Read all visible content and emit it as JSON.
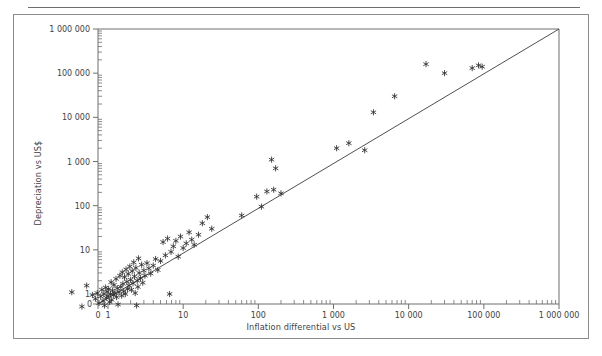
{
  "figure": {
    "has_top_rule": true,
    "border_color": "#8c8c8c",
    "background": "#ffffff"
  },
  "chart_data": {
    "type": "scatter",
    "title": "",
    "subtitle": "",
    "xlabel": "Inflation differential vs US",
    "ylabel": "Depreciation vs US$",
    "x_scale": "log",
    "y_scale": "log",
    "xlim": [
      1,
      1000000
    ],
    "ylim": [
      1,
      1000000
    ],
    "x_tick_labels": [
      "0",
      "1",
      "10",
      "100",
      "1 000",
      "10 000",
      "100 000",
      "1 000 000"
    ],
    "y_tick_labels": [
      "0",
      "1",
      "10",
      "100",
      "1 000",
      "10 000",
      "100 000",
      "1 000 000"
    ],
    "x_tick_values": [
      0,
      1,
      10,
      100,
      1000,
      10000,
      100000,
      1000000
    ],
    "y_tick_values": [
      0,
      1,
      10,
      100,
      1000,
      10000,
      100000,
      1000000
    ],
    "grid": false,
    "legend": "none",
    "minor_ticks": true,
    "marker": "asterisk",
    "marker_color": "#2e2e2e",
    "reference_line": {
      "label": "45-degree line",
      "from": [
        1,
        1
      ],
      "to": [
        1000000,
        1000000
      ],
      "color": "#3c3c3c"
    },
    "series": [
      {
        "name": "Countries",
        "points": [
          [
            0.33,
            1.1
          ],
          [
            0.45,
            0.52
          ],
          [
            0.52,
            1.55
          ],
          [
            0.62,
            0.95
          ],
          [
            0.68,
            0.78
          ],
          [
            0.72,
            1.05
          ],
          [
            0.76,
            0.62
          ],
          [
            0.8,
            0.88
          ],
          [
            0.83,
            1.25
          ],
          [
            0.86,
            0.7
          ],
          [
            0.88,
            1.0
          ],
          [
            0.9,
            0.55
          ],
          [
            0.93,
            1.4
          ],
          [
            0.95,
            0.82
          ],
          [
            0.97,
            1.12
          ],
          [
            1.0,
            0.9
          ],
          [
            1.02,
            1.3
          ],
          [
            1.05,
            0.66
          ],
          [
            1.08,
            1.0
          ],
          [
            1.1,
            1.85
          ],
          [
            1.12,
            0.74
          ],
          [
            1.15,
            1.2
          ],
          [
            1.18,
            0.96
          ],
          [
            1.2,
            1.6
          ],
          [
            1.24,
            1.05
          ],
          [
            1.28,
            2.2
          ],
          [
            1.3,
            0.85
          ],
          [
            1.33,
            1.35
          ],
          [
            1.36,
            0.58
          ],
          [
            1.4,
            1.1
          ],
          [
            1.44,
            2.6
          ],
          [
            1.48,
            1.45
          ],
          [
            1.52,
            0.92
          ],
          [
            1.55,
            3.1
          ],
          [
            1.58,
            1.7
          ],
          [
            1.62,
            1.15
          ],
          [
            1.66,
            2.4
          ],
          [
            1.7,
            1.0
          ],
          [
            1.74,
            3.6
          ],
          [
            1.78,
            1.9
          ],
          [
            1.82,
            1.3
          ],
          [
            1.86,
            2.85
          ],
          [
            1.9,
            1.55
          ],
          [
            1.95,
            4.2
          ],
          [
            2.0,
            2.1
          ],
          [
            2.05,
            1.25
          ],
          [
            2.1,
            3.3
          ],
          [
            2.15,
            1.75
          ],
          [
            2.2,
            5.2
          ],
          [
            2.25,
            2.5
          ],
          [
            2.3,
            1.05
          ],
          [
            2.35,
            3.9
          ],
          [
            2.4,
            0.55
          ],
          [
            2.45,
            2.0
          ],
          [
            2.5,
            1.45
          ],
          [
            2.55,
            6.4
          ],
          [
            2.6,
            3.0
          ],
          [
            2.7,
            2.3
          ],
          [
            2.8,
            4.6
          ],
          [
            2.9,
            1.8
          ],
          [
            3.0,
            3.4
          ],
          [
            3.1,
            2.6
          ],
          [
            3.3,
            5.0
          ],
          [
            3.5,
            3.8
          ],
          [
            3.7,
            2.9
          ],
          [
            4.0,
            4.4
          ],
          [
            4.3,
            6.2
          ],
          [
            4.6,
            3.5
          ],
          [
            5.0,
            5.6
          ],
          [
            5.4,
            15.0
          ],
          [
            5.8,
            7.5
          ],
          [
            6.2,
            18.0
          ],
          [
            6.6,
            1.0
          ],
          [
            6.9,
            9.0
          ],
          [
            7.4,
            12.0
          ],
          [
            8.0,
            16.0
          ],
          [
            8.6,
            7.0
          ],
          [
            9.2,
            20.0
          ],
          [
            10.0,
            11.0
          ],
          [
            11.0,
            14.0
          ],
          [
            12.0,
            25.0
          ],
          [
            13.0,
            17.0
          ],
          [
            14.0,
            13.0
          ],
          [
            16.0,
            22.0
          ],
          [
            18.0,
            40.0
          ],
          [
            21.0,
            55.0
          ],
          [
            24.0,
            30.0
          ],
          [
            60.0,
            60.0
          ],
          [
            95.0,
            160.0
          ],
          [
            110.0,
            95.0
          ],
          [
            130.0,
            210.0
          ],
          [
            150.0,
            1100.0
          ],
          [
            160.0,
            230.0
          ],
          [
            170.0,
            700.0
          ],
          [
            200.0,
            190.0
          ],
          [
            1100.0,
            2000.0
          ],
          [
            1600.0,
            2600.0
          ],
          [
            2600.0,
            1800.0
          ],
          [
            3400.0,
            13000.0
          ],
          [
            6500.0,
            30000.0
          ],
          [
            17000.0,
            160000.0
          ],
          [
            30000.0,
            100000.0
          ],
          [
            70000.0,
            130000.0
          ],
          [
            85000.0,
            150000.0
          ],
          [
            95000.0,
            140000.0
          ]
        ]
      }
    ]
  }
}
